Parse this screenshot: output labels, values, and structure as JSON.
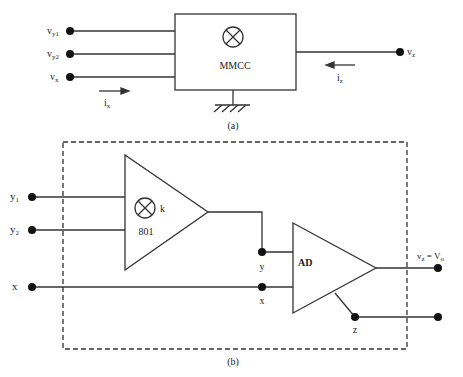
{
  "figure_a": {
    "block_label": "MMCC",
    "caption": "(a)",
    "inputs": [
      {
        "label": "v",
        "sub": "y1"
      },
      {
        "label": "v",
        "sub": "y2"
      },
      {
        "label": "v",
        "sub": "x"
      }
    ],
    "output": {
      "label": "v",
      "sub": "z"
    },
    "currents": {
      "input": {
        "label": "i",
        "sub": "x"
      },
      "output": {
        "label": "i",
        "sub": "z"
      }
    },
    "multiplier_symbol": "⊗"
  },
  "figure_b": {
    "caption": "(b)",
    "multiplier": {
      "label": "801",
      "gain_label": "k"
    },
    "ad_block": {
      "label": "AD"
    },
    "inputs": [
      {
        "label": "y",
        "sub": "1"
      },
      {
        "label": "y",
        "sub": "2"
      },
      {
        "label": "x",
        "sub": ""
      }
    ],
    "nodes": {
      "y": "y",
      "x": "x",
      "z": "z"
    },
    "output": {
      "label": "v",
      "sub": "z",
      "eq": " = V",
      "eq_sub": "o"
    }
  },
  "colors": {
    "stroke": "#333333",
    "text": "#222222",
    "background": "#ffffff"
  }
}
